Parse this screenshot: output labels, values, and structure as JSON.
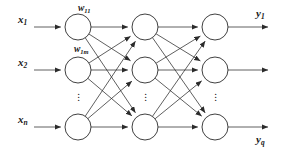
{
  "diagram": {
    "type": "feedforward-neural-network",
    "title": "",
    "layers": [
      {
        "name": "input-layer",
        "x": 78,
        "node_rows": [
          27,
          70,
          127
        ],
        "ellipsis": {
          "x": 78,
          "y": 97
        }
      },
      {
        "name": "hidden-layer",
        "x": 145,
        "node_rows": [
          27,
          70,
          127
        ],
        "ellipsis": {
          "x": 145,
          "y": 97
        }
      },
      {
        "name": "output-layer",
        "x": 215,
        "node_rows": [
          27,
          70,
          127
        ],
        "ellipsis": {
          "x": 215,
          "y": 97
        }
      }
    ],
    "node_radius": 13,
    "stroke_color": "#2b2b2b",
    "background_color": "#ffffff",
    "fully_connected": true
  },
  "input_labels": [
    {
      "base": "x",
      "sub": "1",
      "x": 18,
      "y": 14
    },
    {
      "base": "x",
      "sub": "2",
      "x": 18,
      "y": 57
    },
    {
      "base": "x",
      "sub": "n",
      "x": 18,
      "y": 114
    }
  ],
  "weight_labels": [
    {
      "base": "w",
      "sub": "11",
      "x": 78,
      "y": 4
    },
    {
      "base": "w",
      "sub": "1m",
      "x": 74,
      "y": 45
    }
  ],
  "output_labels": [
    {
      "base": "y",
      "sub": "1",
      "x": 256,
      "y": 8
    },
    {
      "base": "y",
      "sub": "q",
      "x": 256,
      "y": 134
    }
  ],
  "ellipsis_glyph": "⋮",
  "ellipsis_dot": "."
}
